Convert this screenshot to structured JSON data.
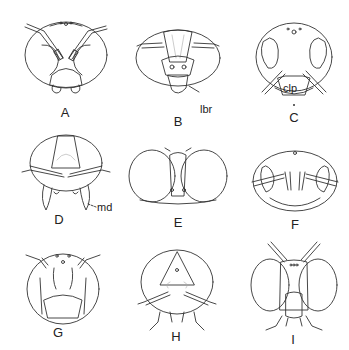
{
  "figure": {
    "panels": [
      {
        "id": "A",
        "label": "A",
        "x": 65,
        "y": 112
      },
      {
        "id": "B",
        "label": "B",
        "x": 178,
        "y": 121
      },
      {
        "id": "C",
        "label": "C",
        "x": 294,
        "y": 117
      },
      {
        "id": "D",
        "label": "D",
        "x": 59,
        "y": 219
      },
      {
        "id": "E",
        "label": "E",
        "x": 178,
        "y": 222
      },
      {
        "id": "F",
        "label": "F",
        "x": 295,
        "y": 224
      },
      {
        "id": "G",
        "label": "G",
        "x": 58,
        "y": 332
      },
      {
        "id": "H",
        "label": "H",
        "x": 176,
        "y": 336
      },
      {
        "id": "I",
        "label": "I",
        "x": 293,
        "y": 339
      }
    ],
    "annotations": [
      {
        "id": "lbr",
        "text": "lbr",
        "x": 203,
        "y": 109
      },
      {
        "id": "clp",
        "text": "clp",
        "x": 282,
        "y": 90
      },
      {
        "id": "md",
        "text": "md",
        "x": 97,
        "y": 207
      }
    ]
  }
}
